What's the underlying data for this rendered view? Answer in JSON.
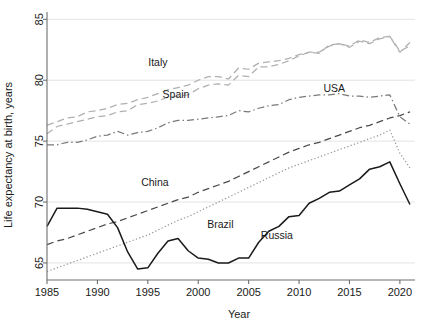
{
  "chart_data": {
    "type": "line",
    "title": "",
    "xlabel": "Year",
    "ylabel": "Life expectancy at birth, years",
    "xlim": [
      1985,
      2021.5
    ],
    "ylim": [
      63.6,
      85.6
    ],
    "xticks": [
      1985,
      1990,
      1995,
      2000,
      2005,
      2010,
      2015,
      2020
    ],
    "xtick_labels": [
      "1985",
      "1990",
      "1995",
      "2000",
      "2005",
      "2010",
      "2015",
      "2020"
    ],
    "yticks": [
      65,
      70,
      75,
      80,
      85
    ],
    "ytick_labels": [
      "65",
      "70",
      "75",
      "80",
      "85"
    ],
    "grid": true,
    "legend": "inline-labels",
    "x": [
      1985,
      1986,
      1987,
      1988,
      1989,
      1990,
      1991,
      1992,
      1993,
      1994,
      1995,
      1996,
      1997,
      1998,
      1999,
      2000,
      2001,
      2002,
      2003,
      2004,
      2005,
      2006,
      2007,
      2008,
      2009,
      2010,
      2011,
      2012,
      2013,
      2014,
      2015,
      2016,
      2017,
      2018,
      2019,
      2020,
      2021
    ],
    "series": [
      {
        "name": "Italy",
        "style": "dashed",
        "color": "#b0b0b0",
        "label_x": 1996,
        "label_y": 81.2,
        "values": [
          76.3,
          76.6,
          76.9,
          77.0,
          77.4,
          77.5,
          77.7,
          78.0,
          78.1,
          78.4,
          78.6,
          78.9,
          79.2,
          79.4,
          79.6,
          80.0,
          80.3,
          80.3,
          80.1,
          81.0,
          80.9,
          81.4,
          81.5,
          81.6,
          81.8,
          82.1,
          82.3,
          82.3,
          82.8,
          83.0,
          82.7,
          83.2,
          83.0,
          83.4,
          83.6,
          82.4,
          82.8
        ]
      },
      {
        "name": "Spain",
        "style": "dashed",
        "color": "#b0b0b0",
        "label_x": 1997.8,
        "label_y": 78.5,
        "values": [
          75.6,
          76.2,
          76.4,
          76.6,
          76.8,
          77.0,
          77.1,
          77.4,
          77.5,
          78.0,
          78.1,
          78.3,
          78.6,
          78.7,
          78.8,
          79.3,
          79.6,
          79.7,
          79.6,
          80.4,
          80.3,
          81.1,
          81.1,
          81.3,
          81.6,
          82.0,
          82.3,
          82.2,
          82.9,
          83.0,
          82.8,
          83.3,
          83.1,
          83.5,
          83.6,
          82.3,
          83.1
        ]
      },
      {
        "name": "USA",
        "style": "dashdot",
        "color": "#7a7a7a",
        "label_x": 2013.5,
        "label_y": 79.0,
        "values": [
          74.7,
          74.7,
          74.9,
          74.9,
          75.1,
          75.4,
          75.5,
          75.8,
          75.5,
          75.7,
          75.8,
          76.1,
          76.5,
          76.7,
          76.7,
          76.8,
          76.9,
          77.0,
          77.1,
          77.5,
          77.4,
          77.7,
          77.9,
          78.0,
          78.4,
          78.6,
          78.7,
          78.8,
          78.8,
          78.9,
          78.7,
          78.7,
          78.6,
          78.7,
          78.8,
          77.0,
          76.4
        ]
      },
      {
        "name": "China",
        "style": "dashed",
        "color": "#4a4a4a",
        "label_x": 1995.7,
        "label_y": 71.3,
        "values": [
          66.5,
          66.8,
          67.0,
          67.3,
          67.6,
          67.9,
          68.2,
          68.4,
          68.7,
          69.0,
          69.3,
          69.6,
          69.9,
          70.2,
          70.4,
          70.8,
          71.1,
          71.4,
          71.7,
          72.1,
          72.5,
          72.9,
          73.3,
          73.7,
          74.1,
          74.4,
          74.7,
          74.9,
          75.2,
          75.5,
          75.8,
          76.1,
          76.3,
          76.6,
          76.9,
          77.1,
          77.4
        ]
      },
      {
        "name": "Brazil",
        "style": "dotted",
        "color": "#9a9a9a",
        "label_x": 2002.2,
        "label_y": 67.9,
        "values": [
          64.3,
          64.6,
          64.9,
          65.2,
          65.5,
          65.8,
          66.1,
          66.4,
          66.7,
          67.0,
          67.3,
          67.7,
          68.1,
          68.5,
          68.8,
          69.2,
          69.6,
          70.0,
          70.4,
          70.8,
          71.2,
          71.6,
          72.0,
          72.4,
          72.8,
          73.1,
          73.4,
          73.7,
          74.0,
          74.3,
          74.6,
          74.9,
          75.2,
          75.5,
          75.9,
          74.0,
          72.8
        ]
      },
      {
        "name": "Russia",
        "style": "solid",
        "color": "#1a1a1a",
        "label_x": 2007.8,
        "label_y": 67.0,
        "values": [
          68.0,
          69.5,
          69.5,
          69.5,
          69.4,
          69.2,
          69.0,
          67.9,
          65.9,
          64.5,
          64.6,
          65.8,
          66.8,
          67.0,
          66.0,
          65.4,
          65.3,
          65.0,
          65.0,
          65.4,
          65.4,
          66.7,
          67.6,
          68.0,
          68.8,
          68.9,
          69.9,
          70.3,
          70.8,
          70.9,
          71.4,
          71.9,
          72.7,
          72.9,
          73.3,
          71.5,
          69.8
        ]
      }
    ]
  }
}
